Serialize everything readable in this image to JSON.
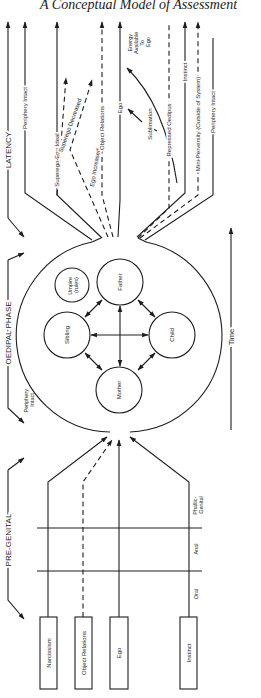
{
  "title": "A Conceptual Model of Assessment",
  "phases": {
    "latency": "LATENCY",
    "oedipal": "OEDIPAL PHASE",
    "pregenital": "PRE-GENITAL"
  },
  "time_axis": {
    "label": "Time"
  },
  "pregenital": {
    "boxes": [
      "Narcissism",
      "Object Relations",
      "Ego",
      "Instinct"
    ],
    "stages": [
      "Oral",
      "Anal",
      "Phallic-Genital"
    ]
  },
  "oedipal": {
    "periphery_label_line1": "Periphery",
    "periphery_label_line2": "Intact",
    "family": {
      "father": "Father",
      "mother": "Mother",
      "sibling": "Sibling",
      "child": "Child",
      "umpire_line1": "Umpire",
      "umpire_line2": "(rules)"
    }
  },
  "latency": {
    "outputs": [
      "Periphery Intact",
      "Superego-Ego Ideal",
      "Superego Decreased",
      "Ego Increased",
      "Object Relations",
      "Ego",
      "Sublimation",
      "Repressed Oedipus",
      "Instinct",
      "Mini-Perversity (Outside of System)",
      "Periphery Intact"
    ],
    "energy_label": [
      "Energy",
      "Available",
      "To",
      "Ego"
    ]
  },
  "colors": {
    "ink": "#1e1e1e",
    "paper": "#ffffff"
  }
}
